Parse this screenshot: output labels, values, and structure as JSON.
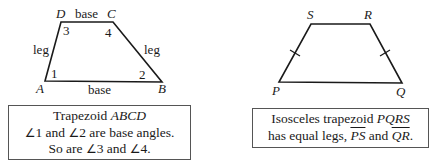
{
  "figure_left": {
    "vertices": {
      "A": "A",
      "B": "B",
      "C": "C",
      "D": "D"
    },
    "side_labels": {
      "top": "base",
      "bottom": "base",
      "left": "leg",
      "right": "leg"
    },
    "angle_labels": {
      "a1": "1",
      "a2": "2",
      "a3": "3",
      "a4": "4"
    },
    "caption": {
      "line1_prefix": "Trapezoid ",
      "line1_name": "ABCD",
      "angle_symbol": "∠",
      "line2_a": "1",
      "line2_and": " and ",
      "line2_b": "2",
      "line2_rest": " are base angles.",
      "line3_prefix": "So are ",
      "line3_a": "3",
      "line3_and": " and ",
      "line3_b": "4",
      "line3_end": "."
    }
  },
  "figure_right": {
    "vertices": {
      "P": "P",
      "Q": "Q",
      "R": "R",
      "S": "S"
    },
    "caption": {
      "line1_prefix": "Isosceles trapezoid ",
      "line1_name": "PQRS",
      "line2_prefix": "has equal legs, ",
      "seg1": "PS",
      "line2_and": " and ",
      "seg2": "QR",
      "line2_end": "."
    }
  }
}
